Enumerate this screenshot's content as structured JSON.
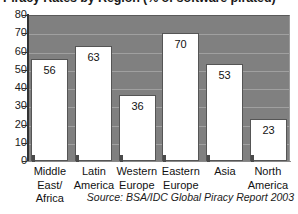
{
  "chart_data": {
    "type": "bar",
    "title": "Piracy Rates by Region (% of software pirated)",
    "xlabel": "",
    "ylabel": "",
    "ylim": [
      0,
      80
    ],
    "ytick_step": 10,
    "yticks": [
      "80",
      "70",
      "60",
      "50",
      "40",
      "30",
      "20",
      "10",
      "0"
    ],
    "grid": true,
    "legend": false,
    "categories": [
      "Middle\nEast/\nAfrica",
      "Latin\nAmerica",
      "Western\nEurope",
      "Eastern\nEurope",
      "Asia",
      "North\nAmerica"
    ],
    "values": [
      56,
      63,
      36,
      70,
      53,
      23
    ],
    "data_labels": [
      "56",
      "63",
      "36",
      "70",
      "53",
      "23"
    ],
    "annotation": "Source: BSA/IDC Global Piracy Report 2003"
  },
  "colors": {
    "plot_background": "#808080",
    "bar_fill": "#ffffff",
    "bar_border": "#555555",
    "gridline": "#a0a0a0",
    "axis": "#333333",
    "text": "#111111",
    "page_background": "#ffffff"
  },
  "chart": {
    "source_note": "Source: BSA/IDC Global Piracy Report 2003"
  }
}
